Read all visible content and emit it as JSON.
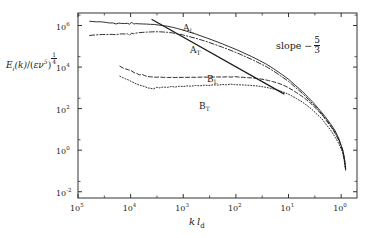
{
  "chart_data": {
    "type": "line",
    "title": "",
    "subtitle": "",
    "xlabel": "k l_d",
    "ylabel": "E_i(k)/(εν⁵)^(1/4)",
    "xlabel_parts": {
      "k": "k",
      "l": "l",
      "sub": "d"
    },
    "ylabel_parts": {
      "E": "E",
      "Esub": "i",
      "karg": "(k)",
      "slash": "/",
      "open": "(",
      "eps": "ε",
      "nu": "ν",
      "nuexp": "5",
      "close": ")",
      "frac_num": "1",
      "frac_den": "4"
    },
    "xscale": "log",
    "yscale": "log",
    "x_axis_reversed": true,
    "xlim": [
      100000,
      0.5
    ],
    "ylim": [
      0.005,
      4000000
    ],
    "grid": false,
    "legend_position": "inline-labels",
    "xticks": [
      {
        "value": 100000,
        "label": "10",
        "exponent": "5"
      },
      {
        "value": 10000,
        "label": "10",
        "exponent": "4"
      },
      {
        "value": 1000,
        "label": "10",
        "exponent": "3"
      },
      {
        "value": 100,
        "label": "10",
        "exponent": "2"
      },
      {
        "value": 10,
        "label": "10",
        "exponent": "1"
      },
      {
        "value": 1,
        "label": "10",
        "exponent": "0"
      }
    ],
    "yticks": [
      {
        "value": 1000000,
        "label": "10",
        "exponent": "6"
      },
      {
        "value": 10000,
        "label": "10",
        "exponent": "4"
      },
      {
        "value": 100,
        "label": "10",
        "exponent": "2"
      },
      {
        "value": 1,
        "label": "10",
        "exponent": "0"
      },
      {
        "value": 0.01,
        "label": "10",
        "exponent": "-2"
      }
    ],
    "annotations": [
      {
        "name": "slope-reference",
        "text": "slope − 5/3",
        "text_lead": "slope −",
        "frac_num": "5",
        "frac_den": "3",
        "slope": -1.6667,
        "line_x": [
          4000,
          12
        ],
        "line_y": [
          2000000,
          500
        ]
      }
    ],
    "series": [
      {
        "name": "A_L",
        "label": "A",
        "label_sub": "L",
        "linestyle": "solid",
        "color": "#1a1a1a",
        "points": [
          [
            60000,
            1600000
          ],
          [
            52000,
            1560000
          ],
          [
            45000,
            1500000
          ],
          [
            40000,
            1520000
          ],
          [
            34000,
            1480000
          ],
          [
            29000,
            1400000
          ],
          [
            25000,
            1320000
          ],
          [
            22000,
            1340000
          ],
          [
            19000,
            1180000
          ],
          [
            17000,
            1300000
          ],
          [
            15000,
            1260000
          ],
          [
            13000,
            1240000
          ],
          [
            11500,
            1270000
          ],
          [
            10500,
            1160000
          ],
          [
            9500,
            1440000
          ],
          [
            8800,
            1180000
          ],
          [
            8000,
            1230000
          ],
          [
            7000,
            1210000
          ],
          [
            6000,
            1190000
          ],
          [
            5000,
            1170000
          ],
          [
            4200,
            1140000
          ],
          [
            3500,
            1120000
          ],
          [
            3000,
            1060000
          ],
          [
            2500,
            1000000
          ],
          [
            2000,
            920000
          ],
          [
            1600,
            820000
          ],
          [
            1300,
            720000
          ],
          [
            1000,
            600000
          ],
          [
            800,
            500000
          ],
          [
            600,
            400000
          ],
          [
            450,
            310000
          ],
          [
            340,
            240000
          ],
          [
            250,
            180000
          ],
          [
            180,
            130000
          ],
          [
            130,
            93000
          ],
          [
            95,
            67000
          ],
          [
            70,
            47000
          ],
          [
            50,
            32000
          ],
          [
            36,
            21000
          ],
          [
            26,
            13500
          ],
          [
            19,
            8200
          ],
          [
            14,
            4800
          ],
          [
            10,
            2600
          ],
          [
            7.5,
            1350
          ],
          [
            5.5,
            680
          ],
          [
            4.2,
            340
          ],
          [
            3.2,
            165
          ],
          [
            2.5,
            80
          ],
          [
            2.0,
            40
          ],
          [
            1.6,
            19
          ],
          [
            1.3,
            8.5
          ],
          [
            1.1,
            3.5
          ],
          [
            1.0,
            1.7
          ],
          [
            0.92,
            0.9
          ],
          [
            0.86,
            0.35
          ],
          [
            0.82,
            0.13
          ]
        ]
      },
      {
        "name": "A_T",
        "label": "A",
        "label_sub": "T",
        "linestyle": "dashdot",
        "color": "#1a1a1a",
        "points": [
          [
            60000,
            330000
          ],
          [
            52000,
            345000
          ],
          [
            45000,
            355000
          ],
          [
            40000,
            360000
          ],
          [
            34000,
            370000
          ],
          [
            29000,
            365000
          ],
          [
            25000,
            375000
          ],
          [
            22000,
            370000
          ],
          [
            19000,
            360000
          ],
          [
            17000,
            385000
          ],
          [
            15000,
            395000
          ],
          [
            13000,
            390000
          ],
          [
            11500,
            400000
          ],
          [
            10500,
            345000
          ],
          [
            9500,
            430000
          ],
          [
            8800,
            400000
          ],
          [
            8000,
            430000
          ],
          [
            7000,
            450000
          ],
          [
            6000,
            465000
          ],
          [
            5000,
            480000
          ],
          [
            4200,
            490000
          ],
          [
            3500,
            500000
          ],
          [
            3000,
            500000
          ],
          [
            2500,
            490000
          ],
          [
            2000,
            470000
          ],
          [
            1600,
            440000
          ],
          [
            1300,
            400000
          ],
          [
            1000,
            350000
          ],
          [
            800,
            300000
          ],
          [
            600,
            250000
          ],
          [
            450,
            200000
          ],
          [
            340,
            160000
          ],
          [
            250,
            122000
          ],
          [
            180,
            90000
          ],
          [
            130,
            66000
          ],
          [
            95,
            48000
          ],
          [
            70,
            34000
          ],
          [
            50,
            23500
          ],
          [
            36,
            15500
          ],
          [
            26,
            10200
          ],
          [
            19,
            6300
          ],
          [
            14,
            3700
          ],
          [
            10,
            2050
          ],
          [
            7.5,
            1080
          ],
          [
            5.5,
            550
          ],
          [
            4.2,
            280
          ],
          [
            3.2,
            138
          ],
          [
            2.5,
            68
          ],
          [
            2.0,
            34
          ],
          [
            1.6,
            16
          ],
          [
            1.3,
            7.2
          ],
          [
            1.1,
            3.0
          ],
          [
            1.0,
            1.45
          ],
          [
            0.92,
            0.76
          ],
          [
            0.86,
            0.3
          ],
          [
            0.82,
            0.11
          ]
        ]
      },
      {
        "name": "B_L",
        "label": "B",
        "label_sub": "L",
        "linestyle": "dashed",
        "color": "#1a1a1a",
        "points": [
          [
            16000,
            11000
          ],
          [
            14000,
            9000
          ],
          [
            12500,
            8200
          ],
          [
            11000,
            7400
          ],
          [
            9800,
            6800
          ],
          [
            8600,
            5400
          ],
          [
            7600,
            4900
          ],
          [
            6800,
            4200
          ],
          [
            6000,
            4400
          ],
          [
            5400,
            3900
          ],
          [
            4800,
            3500
          ],
          [
            4200,
            3400
          ],
          [
            3700,
            3300
          ],
          [
            3200,
            3250
          ],
          [
            2800,
            3300
          ],
          [
            2400,
            3200
          ],
          [
            2000,
            3150
          ],
          [
            1700,
            3200
          ],
          [
            1400,
            3150
          ],
          [
            1200,
            3200
          ],
          [
            1000,
            3180
          ],
          [
            850,
            3200
          ],
          [
            700,
            3250
          ],
          [
            580,
            3200
          ],
          [
            480,
            3280
          ],
          [
            400,
            3300
          ],
          [
            330,
            3250
          ],
          [
            270,
            3300
          ],
          [
            220,
            3350
          ],
          [
            180,
            3300
          ],
          [
            150,
            3400
          ],
          [
            125,
            3300
          ],
          [
            105,
            3450
          ],
          [
            88,
            3300
          ],
          [
            72,
            3200
          ],
          [
            60,
            3100
          ],
          [
            50,
            3000
          ],
          [
            42,
            2850
          ],
          [
            35,
            2700
          ],
          [
            29,
            2500
          ],
          [
            24,
            2250
          ],
          [
            20,
            2000
          ],
          [
            16,
            1700
          ],
          [
            13,
            1400
          ],
          [
            10.5,
            1080
          ],
          [
            8.5,
            800
          ],
          [
            7,
            580
          ],
          [
            5.6,
            400
          ],
          [
            4.5,
            260
          ],
          [
            3.6,
            160
          ],
          [
            2.9,
            92
          ],
          [
            2.3,
            50
          ],
          [
            1.9,
            26
          ],
          [
            1.55,
            13
          ],
          [
            1.28,
            6.0
          ],
          [
            1.08,
            2.6
          ],
          [
            0.95,
            1.2
          ],
          [
            0.88,
            0.48
          ],
          [
            0.83,
            0.16
          ]
        ]
      },
      {
        "name": "B_T",
        "label": "B",
        "label_sub": "T",
        "linestyle": "dotted",
        "color": "#1a1a1a",
        "points": [
          [
            16000,
            3600
          ],
          [
            14000,
            3100
          ],
          [
            12500,
            2700
          ],
          [
            11000,
            2400
          ],
          [
            9800,
            2050
          ],
          [
            8600,
            1750
          ],
          [
            7600,
            1500
          ],
          [
            6800,
            1350
          ],
          [
            6000,
            1250
          ],
          [
            5400,
            1150
          ],
          [
            4800,
            1000
          ],
          [
            4200,
            950
          ],
          [
            3700,
            900
          ],
          [
            3200,
            1050
          ],
          [
            2800,
            1000
          ],
          [
            2400,
            1100
          ],
          [
            2000,
            1050
          ],
          [
            1700,
            1150
          ],
          [
            1400,
            1100
          ],
          [
            1200,
            1200
          ],
          [
            1000,
            1150
          ],
          [
            850,
            1250
          ],
          [
            700,
            1200
          ],
          [
            580,
            1300
          ],
          [
            480,
            1250
          ],
          [
            400,
            1350
          ],
          [
            330,
            1300
          ],
          [
            270,
            1400
          ],
          [
            220,
            1350
          ],
          [
            180,
            1450
          ],
          [
            150,
            1400
          ],
          [
            125,
            1500
          ],
          [
            105,
            1420
          ],
          [
            88,
            1400
          ],
          [
            72,
            1380
          ],
          [
            60,
            1340
          ],
          [
            50,
            1300
          ],
          [
            42,
            1250
          ],
          [
            35,
            1180
          ],
          [
            29,
            1100
          ],
          [
            24,
            1000
          ],
          [
            20,
            900
          ],
          [
            16,
            780
          ],
          [
            13,
            650
          ],
          [
            10.5,
            520
          ],
          [
            8.5,
            400
          ],
          [
            7,
            300
          ],
          [
            5.6,
            215
          ],
          [
            4.5,
            145
          ],
          [
            3.6,
            92
          ],
          [
            2.9,
            55
          ],
          [
            2.3,
            31
          ],
          [
            1.9,
            16.5
          ],
          [
            1.55,
            8.5
          ],
          [
            1.28,
            4.0
          ],
          [
            1.08,
            1.8
          ],
          [
            0.95,
            0.85
          ],
          [
            0.88,
            0.35
          ],
          [
            0.83,
            0.12
          ]
        ]
      }
    ]
  },
  "plot_frame": {
    "left": 78,
    "top": 13,
    "right": 357,
    "bottom": 198,
    "border_color": "#333333"
  }
}
